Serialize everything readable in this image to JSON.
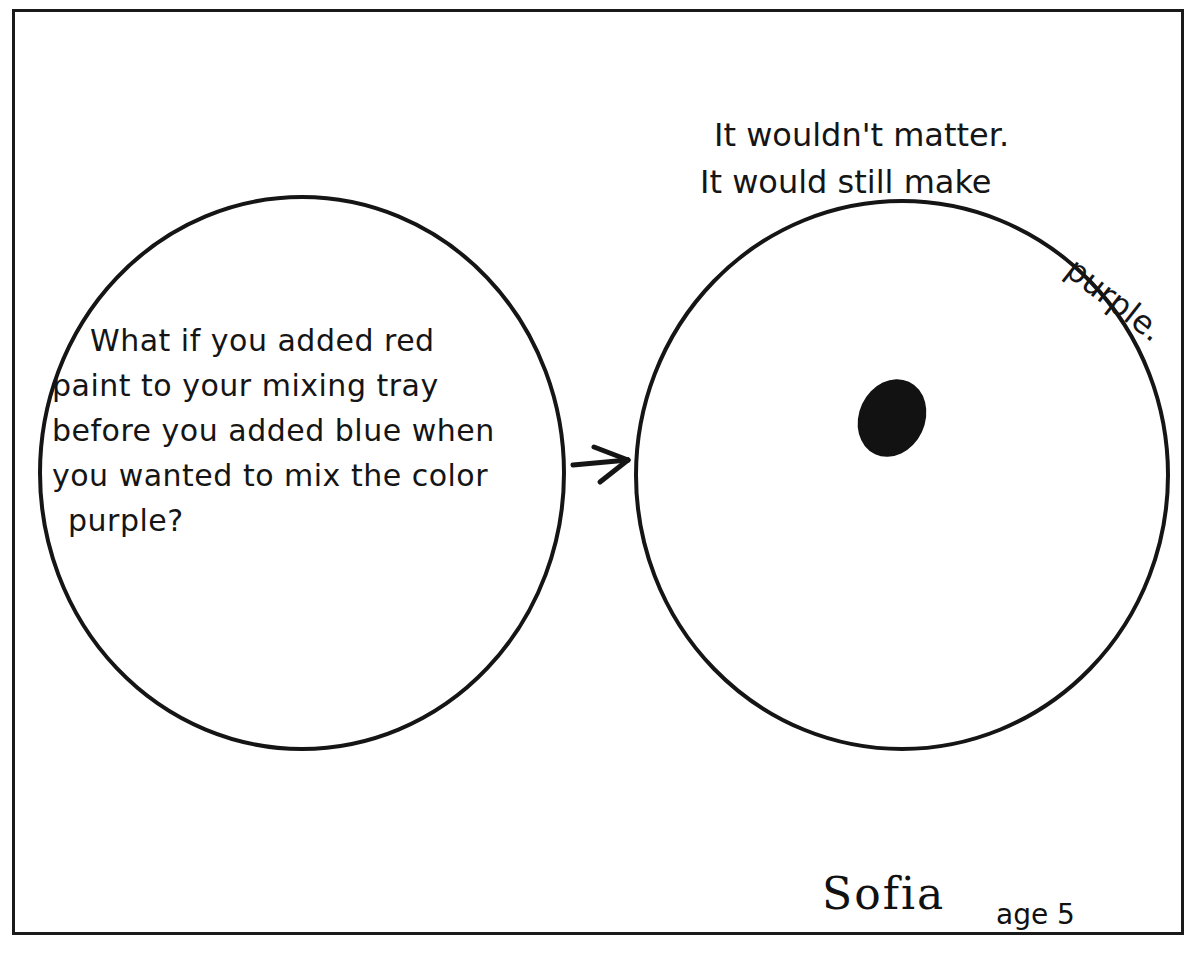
{
  "drawing": {
    "left_bubble": {
      "lines": [
        "What if you added red",
        "paint to your mixing tray",
        "before you added blue when",
        "you wanted to mix the color",
        "purple?"
      ]
    },
    "arrow": "→",
    "right_bubble": {
      "answer_lines": [
        "It wouldn't matter.",
        "It would still make",
        "purple."
      ],
      "contents": "dark paint blob"
    },
    "signature": {
      "name": "Sofia",
      "age": "age 5"
    },
    "colors": {
      "ink": "#151515",
      "paper": "#ffffff"
    }
  }
}
